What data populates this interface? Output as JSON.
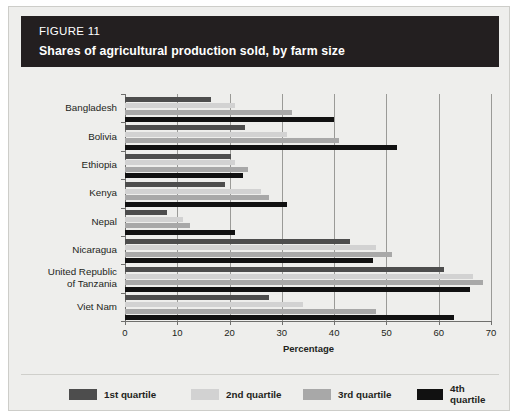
{
  "figure": {
    "number_label": "FIGURE 11",
    "title": "Shares of agricultural production sold, by farm size"
  },
  "colors": {
    "header_background": "#231f20",
    "header_text": "#ffffff",
    "panel_background": "#eeeeec",
    "q1": "#4d4d4d",
    "q2": "#d2d2d2",
    "q3": "#a8a8a8",
    "q4": "#111111",
    "gridline": "#9a9a97",
    "axis": "#6f6f6d"
  },
  "chart_data": {
    "type": "bar",
    "orientation": "horizontal",
    "title": "Shares of agricultural production sold, by farm size",
    "xlabel": "Percentage",
    "ylabel": "",
    "xlim": [
      0,
      70
    ],
    "xticks": [
      0,
      10,
      20,
      30,
      40,
      50,
      60,
      70
    ],
    "xtick_labels": [
      "0",
      "10",
      "20",
      "30",
      "40",
      "50",
      "60",
      "70"
    ],
    "grid": true,
    "legend_position": "bottom",
    "categories": [
      "Bangladesh",
      "Bolivia",
      "Ethiopia",
      "Kenya",
      "Nepal",
      "Nicaragua",
      "United Republic of Tanzania",
      "Viet Nam"
    ],
    "series": [
      {
        "name": "1st quartile",
        "color": "#4d4d4d",
        "values": [
          16.5,
          23.0,
          20.3,
          19.2,
          8.0,
          43.0,
          61.0,
          27.5
        ]
      },
      {
        "name": "2nd quartile",
        "color": "#d2d2d2",
        "values": [
          21.0,
          31.0,
          21.0,
          26.0,
          11.0,
          48.0,
          66.5,
          34.0
        ]
      },
      {
        "name": "3rd quartile",
        "color": "#a8a8a8",
        "values": [
          32.0,
          41.0,
          23.5,
          27.5,
          12.5,
          51.0,
          68.5,
          48.0
        ]
      },
      {
        "name": "4th quartile",
        "color": "#111111",
        "values": [
          40.0,
          52.0,
          22.5,
          31.0,
          21.0,
          47.5,
          66.0,
          63.0
        ]
      }
    ]
  },
  "legend": {
    "items": [
      {
        "label": "1st quartile",
        "color": "#4d4d4d"
      },
      {
        "label": "2nd quartile",
        "color": "#d2d2d2"
      },
      {
        "label": "3rd quartile",
        "color": "#a8a8a8"
      },
      {
        "label": "4th quartile",
        "color": "#111111"
      }
    ]
  }
}
